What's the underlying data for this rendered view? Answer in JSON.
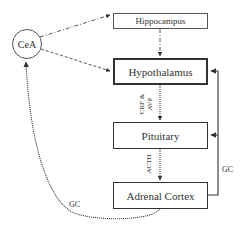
{
  "diagram": {
    "nodes": {
      "cea": "CeA",
      "hippocampus": "Hippocampus",
      "hypothalamus": "Hypothalamus",
      "pituitary": "Pituitary",
      "adrenal": "Adrenal Cortex"
    },
    "edge_labels": {
      "crf_avp_line1": "CRF &",
      "crf_avp_line2": "AVP",
      "acth": "ACTH",
      "gc_right": "GC",
      "gc_left": "GC"
    },
    "edges": [
      {
        "from": "CeA",
        "to": "Hippocampus",
        "style": "dash-dot"
      },
      {
        "from": "CeA",
        "to": "Hypothalamus",
        "style": "dashed"
      },
      {
        "from": "Hippocampus",
        "to": "Hypothalamus",
        "style": "dash-dot"
      },
      {
        "from": "Hypothalamus",
        "to": "Pituitary",
        "style": "dotted",
        "label": "CRF & AVP"
      },
      {
        "from": "Pituitary",
        "to": "Adrenal Cortex",
        "style": "dotted",
        "label": "ACTH"
      },
      {
        "from": "Adrenal Cortex",
        "to": "Hypothalamus",
        "style": "solid",
        "label": "GC"
      },
      {
        "from": "Adrenal Cortex",
        "to": "Pituitary",
        "style": "solid",
        "label": "GC"
      },
      {
        "from": "Adrenal Cortex",
        "to": "CeA",
        "style": "dotted",
        "label": "GC"
      }
    ],
    "colors": {
      "line": "#333333",
      "box_border": "#444444",
      "background": "#ffffff"
    }
  }
}
